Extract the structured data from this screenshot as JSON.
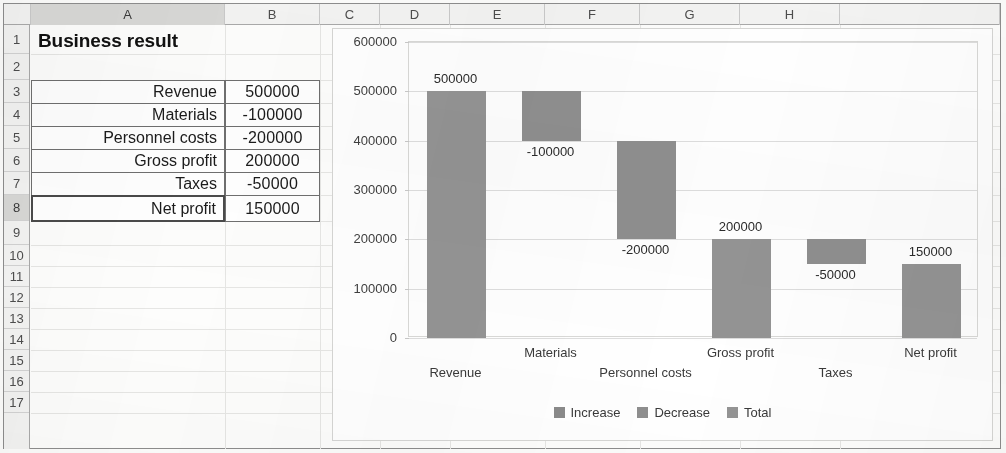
{
  "spreadsheet": {
    "columns": [
      "A",
      "B",
      "C",
      "D",
      "E",
      "F",
      "G",
      "H"
    ],
    "selected_column": "A",
    "rows": [
      "1",
      "2",
      "3",
      "4",
      "5",
      "6",
      "7",
      "8",
      "9",
      "10",
      "11",
      "12",
      "13",
      "14",
      "15",
      "16",
      "17"
    ],
    "selected_row": "8",
    "title_cell": "Business result",
    "table": {
      "rows": [
        {
          "row": "3",
          "label": "Revenue",
          "value": "500000"
        },
        {
          "row": "4",
          "label": "Materials",
          "value": "-100000"
        },
        {
          "row": "5",
          "label": "Personnel costs",
          "value": "-200000"
        },
        {
          "row": "6",
          "label": "Gross profit",
          "value": "200000"
        },
        {
          "row": "7",
          "label": "Taxes",
          "value": "-50000"
        },
        {
          "row": "8",
          "label": "Net profit",
          "value": "150000"
        }
      ]
    }
  },
  "chart_data": {
    "type": "bar",
    "chart_subtype": "waterfall",
    "title": "",
    "xlabel": "",
    "ylabel": "",
    "ylim": [
      0,
      600000
    ],
    "ytick_labels": [
      "0",
      "100000",
      "200000",
      "300000",
      "400000",
      "500000",
      "600000"
    ],
    "ytick_values": [
      0,
      100000,
      200000,
      300000,
      400000,
      500000,
      600000
    ],
    "grid": true,
    "legend_position": "bottom",
    "categories": [
      "Revenue",
      "Materials",
      "Personnel costs",
      "Gross profit",
      "Taxes",
      "Net profit"
    ],
    "values": [
      500000,
      -100000,
      -200000,
      200000,
      -50000,
      150000
    ],
    "data_labels": [
      "500000",
      "-100000",
      "-200000",
      "200000",
      "-50000",
      "150000"
    ],
    "bars": [
      {
        "category": "Revenue",
        "label": "500000",
        "base": 0,
        "top": 500000,
        "kind": "total",
        "label_pos": "above"
      },
      {
        "category": "Materials",
        "label": "-100000",
        "base": 400000,
        "top": 500000,
        "kind": "decrease",
        "label_pos": "below"
      },
      {
        "category": "Personnel costs",
        "label": "-200000",
        "base": 200000,
        "top": 400000,
        "kind": "decrease",
        "label_pos": "below"
      },
      {
        "category": "Gross profit",
        "label": "200000",
        "base": 0,
        "top": 200000,
        "kind": "total",
        "label_pos": "above"
      },
      {
        "category": "Taxes",
        "label": "-50000",
        "base": 150000,
        "top": 200000,
        "kind": "decrease",
        "label_pos": "below"
      },
      {
        "category": "Net profit",
        "label": "150000",
        "base": 0,
        "top": 150000,
        "kind": "total",
        "label_pos": "above"
      }
    ],
    "legend": [
      {
        "name": "Increase",
        "color": "#8a8a8a"
      },
      {
        "name": "Decrease",
        "color": "#8f8f8f"
      },
      {
        "name": "Total",
        "color": "#949494"
      }
    ]
  }
}
